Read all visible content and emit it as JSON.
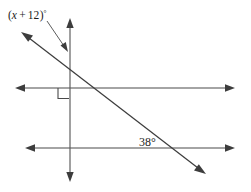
{
  "diagram": {
    "background_color": "#ffffff",
    "line_color": "#4a4a4a",
    "text_color": "#1c1c1c",
    "labels": {
      "expression_angle": "(x + 12)°",
      "expression_angle_parts": {
        "open_paren": "(",
        "variable": "x",
        "operator": "+",
        "constant": "12",
        "close_paren": ")",
        "degree": "°"
      },
      "known_angle": "38°",
      "known_angle_value": 38
    },
    "elements": {
      "upper_horizontal": {
        "name": "upper-horizontal-line",
        "x1": 17,
        "y1": 88,
        "x2": 233,
        "y2": 88,
        "arrows": "both"
      },
      "lower_horizontal": {
        "name": "lower-horizontal-line",
        "x1": 27,
        "y1": 148,
        "x2": 233,
        "y2": 148,
        "arrows": "both"
      },
      "vertical": {
        "name": "vertical-line",
        "x1": 70,
        "y1": 20,
        "x2": 70,
        "y2": 180,
        "arrows": "both"
      },
      "diagonal": {
        "name": "diagonal-transversal-line",
        "x1": 22,
        "y1": 33,
        "x2": 205,
        "y2": 174,
        "arrows": "both"
      },
      "pointer": {
        "name": "label-pointer-arrow",
        "x1": 47,
        "y1": 20,
        "x2": 67,
        "y2": 50
      },
      "right_angle_square": {
        "name": "right-angle-marker",
        "x": 58,
        "y": 88,
        "size": 11
      }
    },
    "label_positions": {
      "expression_angle": {
        "x": 8,
        "y": 18
      },
      "known_angle": {
        "x": 139,
        "y": 146
      }
    },
    "intersections": {
      "diagonal_vertical": {
        "x": 62,
        "y": 57
      },
      "diagonal_upper_horizontal": {
        "x": 96,
        "y": 88
      },
      "diagonal_lower_horizontal": {
        "x": 172,
        "y": 148
      },
      "vertical_upper_horizontal": {
        "x": 70,
        "y": 88
      },
      "vertical_lower_horizontal": {
        "x": 70,
        "y": 148
      }
    }
  }
}
